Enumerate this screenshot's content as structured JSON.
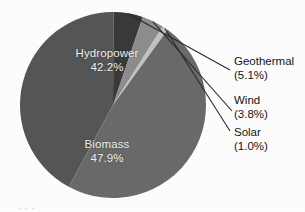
{
  "chart_data": {
    "type": "pie",
    "title": "",
    "subtitle": "",
    "xlabel": "",
    "ylabel": "",
    "legend_position": "none",
    "grid": false,
    "categories": [
      "Biomass",
      "Hydropower",
      "Geothermal",
      "Wind",
      "Solar"
    ],
    "values": [
      47.9,
      42.2,
      5.1,
      3.8,
      1.0
    ],
    "units": "percent",
    "slices": [
      {
        "name": "Hydropower",
        "label": "Hydropower",
        "value": 42.2,
        "value_label": "42.2%",
        "color": "#565656",
        "label_placement": "inside"
      },
      {
        "name": "Geothermal",
        "label": "Geothermal",
        "value": 5.1,
        "value_label": "(5.1%)",
        "color": "#3a3a3a",
        "label_placement": "callout"
      },
      {
        "name": "Wind",
        "label": "Wind",
        "value": 3.8,
        "value_label": "(3.8%)",
        "color": "#8e8e8e",
        "label_placement": "callout"
      },
      {
        "name": "Solar",
        "label": "Solar",
        "value": 1.0,
        "value_label": "(1.0%)",
        "color": "#c4c4c4",
        "label_placement": "callout"
      },
      {
        "name": "Biomass",
        "label": "Biomass",
        "value": 47.9,
        "value_label": "47.9%",
        "color": "#6b6b6b",
        "label_placement": "inside"
      }
    ]
  },
  "caption": {
    "fragment": ". . ."
  },
  "colors": {
    "background": "#ffffff",
    "inside_label_text": "#f2f2f2",
    "callout_label_text": "#151515",
    "leader_line": "#2a2a2a"
  }
}
